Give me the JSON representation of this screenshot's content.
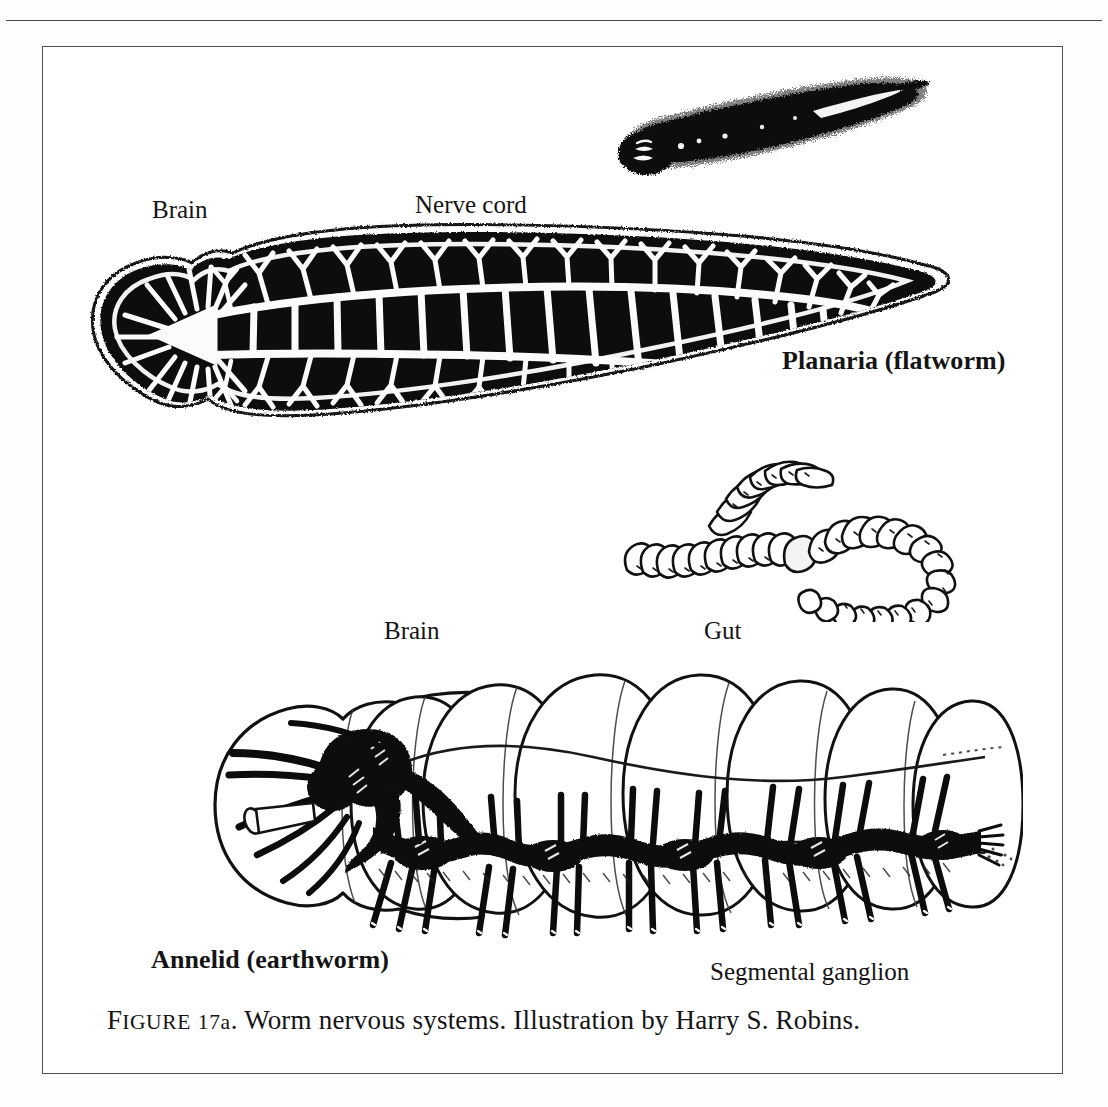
{
  "figure": {
    "caption_prefix": "Figure",
    "caption_number": "17a",
    "caption_title": "Worm nervous systems.",
    "caption_credit": "Illustration by Harry S. Robins.",
    "caption_full": "Figure 17a. Worm nervous systems. Illustration by Harry S. Robins."
  },
  "labels": {
    "brain_planaria": "Brain",
    "nerve_cord": "Nerve cord",
    "planaria_title": "Planaria (flatworm)",
    "brain_annelid": "Brain",
    "gut": "Gut",
    "annelid_title": "Annelid (earthworm)",
    "segmental_ganglion": "Segmental ganglion"
  },
  "illustrations": {
    "planaria_habitus": "planaria-whole-animal-sketch",
    "planaria_nervous_system": "planaria-nervous-system-diagram",
    "earthworm_habitus": "earthworm-whole-animal-sketch",
    "annelid_nervous_system": "annelid-nervous-system-cutaway"
  },
  "colors": {
    "ink": "#141414",
    "paper": "#ffffff",
    "rule": "#4a4a4a",
    "frame": "#4d4d52"
  }
}
